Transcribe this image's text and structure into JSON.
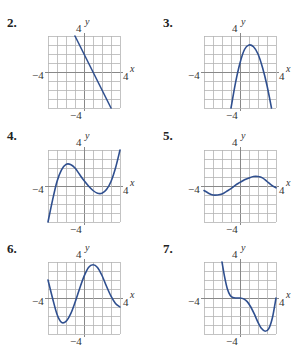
{
  "colors": {
    "curve": "#2f4f8f",
    "grid": "#b4b4b4",
    "axis": "#888888"
  },
  "axes": {
    "x_label": "x",
    "y_label": "y",
    "y_top_tick": "4",
    "y_bottom_tick": "−4",
    "x_left_tick": "−4",
    "x_right_tick": "4"
  },
  "chart_data": [
    {
      "type": "line",
      "title": "2.",
      "xlim": [
        -4,
        4
      ],
      "ylim": [
        -4,
        4
      ],
      "grid": true,
      "x": [
        -1,
        3
      ],
      "y": [
        4,
        -4
      ]
    },
    {
      "type": "line",
      "title": "3.",
      "xlim": [
        -4,
        4
      ],
      "ylim": [
        -4,
        4
      ],
      "grid": true,
      "x": [
        -1,
        -0.5,
        0,
        0.5,
        1,
        1.5,
        2,
        2.5,
        3,
        3.5
      ],
      "y": [
        -4,
        -1.2,
        1,
        2.5,
        3,
        2.8,
        2,
        0.5,
        -1.5,
        -4
      ]
    },
    {
      "type": "line",
      "title": "4.",
      "xlim": [
        -4,
        4
      ],
      "ylim": [
        -4,
        4
      ],
      "grid": true,
      "x": [
        -4,
        -3.5,
        -3,
        -2.5,
        -2,
        -1.5,
        -1,
        -0.5,
        0,
        0.5,
        1,
        1.5,
        2,
        2.5,
        3,
        3.5,
        4
      ],
      "y": [
        -4,
        -1.6,
        0.5,
        1.8,
        2.4,
        2.4,
        2.0,
        1.3,
        0.6,
        0,
        -0.5,
        -0.8,
        -0.8,
        -0.4,
        0.5,
        2,
        4
      ]
    },
    {
      "type": "line",
      "title": "5.",
      "xlim": [
        -4,
        4
      ],
      "ylim": [
        -4,
        4
      ],
      "grid": true,
      "x": [
        -4,
        -3.5,
        -3,
        -2.5,
        -2,
        -1.5,
        -1,
        -0.5,
        0,
        0.5,
        1,
        1.5,
        2,
        2.5,
        3,
        3.5,
        4
      ],
      "y": [
        -0.5,
        -0.8,
        -1,
        -1,
        -0.9,
        -0.6,
        -0.3,
        0.1,
        0.4,
        0.7,
        0.9,
        1.05,
        1.05,
        0.9,
        0.5,
        0.1,
        -0.2
      ]
    },
    {
      "type": "line",
      "title": "6.",
      "xlim": [
        -4,
        4
      ],
      "ylim": [
        -4,
        4
      ],
      "grid": true,
      "x": [
        -4,
        -3.5,
        -3,
        -2.5,
        -2,
        -1.5,
        -1,
        -0.5,
        0,
        0.5,
        1,
        1.5,
        2,
        2.5,
        3,
        3.5,
        4
      ],
      "y": [
        2,
        0,
        -1.8,
        -2.7,
        -2.6,
        -1.8,
        -0.5,
        1,
        2.4,
        3.4,
        3.7,
        3.4,
        2.5,
        1.3,
        0.2,
        -0.6,
        -1
      ]
    },
    {
      "type": "line",
      "title": "7.",
      "xlim": [
        -4,
        4
      ],
      "ylim": [
        -4,
        4
      ],
      "grid": true,
      "x": [
        -2,
        -1.7,
        -1.4,
        -1.1,
        -0.8,
        -0.4,
        0,
        0.4,
        0.8,
        1.2,
        1.6,
        2,
        2.4,
        2.8,
        3.2,
        3.6,
        4
      ],
      "y": [
        4,
        2.3,
        1,
        0.3,
        0.05,
        0,
        0,
        -0.1,
        -0.4,
        -1,
        -1.8,
        -2.7,
        -3.4,
        -3.7,
        -3.4,
        -2.2,
        0
      ]
    }
  ],
  "panels": [
    {
      "label": "2."
    },
    {
      "label": "3."
    },
    {
      "label": "4."
    },
    {
      "label": "5."
    },
    {
      "label": "6."
    },
    {
      "label": "7."
    }
  ]
}
